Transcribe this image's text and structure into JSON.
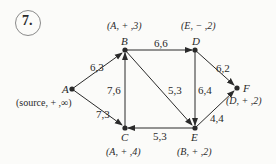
{
  "problem": {
    "number": "7."
  },
  "nodes": {
    "A": {
      "name": "A",
      "label": "(source, + ,∞)"
    },
    "B": {
      "name": "B",
      "label": "(A, + ,3)"
    },
    "C": {
      "name": "C",
      "label": "(A, + ,4)"
    },
    "D": {
      "name": "D",
      "label": "(E, − ,2)"
    },
    "E": {
      "name": "E",
      "label": "(B, + ,2)"
    },
    "F": {
      "name": "F",
      "label": "(D, + ,2)"
    }
  },
  "edges": [
    {
      "from": "A",
      "to": "B",
      "label": "6,3"
    },
    {
      "from": "A",
      "to": "C",
      "label": "7,3"
    },
    {
      "from": "C",
      "to": "B",
      "label": "7,6"
    },
    {
      "from": "B",
      "to": "D",
      "label": "6,6"
    },
    {
      "from": "B",
      "to": "E",
      "label": "5,3"
    },
    {
      "from": "D",
      "to": "E",
      "label": "6,4"
    },
    {
      "from": "D",
      "to": "F",
      "label": "6,2"
    },
    {
      "from": "E",
      "to": "F",
      "label": "4,4"
    },
    {
      "from": "E",
      "to": "C",
      "label": "5,3"
    }
  ],
  "colors": {
    "ink": "#2a2a2a",
    "background": "#fbfbf9"
  }
}
